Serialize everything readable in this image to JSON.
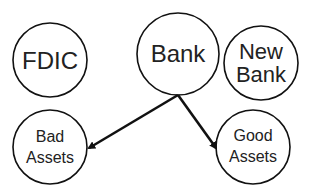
{
  "diagram": {
    "nodes": [
      {
        "id": "fdic",
        "lines": [
          "FDIC"
        ],
        "cx": 50,
        "cy": 60,
        "r": 37,
        "font": 24
      },
      {
        "id": "bank",
        "lines": [
          "Bank"
        ],
        "cx": 178,
        "cy": 54,
        "r": 41,
        "font": 24
      },
      {
        "id": "new-bank",
        "lines": [
          "New",
          "Bank"
        ],
        "cx": 261,
        "cy": 63,
        "r": 37,
        "font": 23
      },
      {
        "id": "bad-assets",
        "lines": [
          "Bad",
          "Assets"
        ],
        "cx": 50,
        "cy": 147,
        "r": 37,
        "font": 17
      },
      {
        "id": "good-assets",
        "lines": [
          "Good",
          "Assets"
        ],
        "cx": 253,
        "cy": 147,
        "r": 37,
        "font": 17
      }
    ],
    "edges": [
      {
        "from": "bank",
        "to": "bad-assets",
        "x1": 178,
        "y1": 95,
        "x2": 88,
        "y2": 149
      },
      {
        "from": "bank",
        "to": "good-assets",
        "x1": 178,
        "y1": 95,
        "x2": 217,
        "y2": 149
      }
    ],
    "stroke_color": "#111111"
  },
  "labels": {
    "fdic": {
      "line1": "FDIC"
    },
    "bank": {
      "line1": "Bank"
    },
    "new_bank": {
      "line1": "New",
      "line2": "Bank"
    },
    "bad_assets": {
      "line1": "Bad",
      "line2": "Assets"
    },
    "good_assets": {
      "line1": "Good",
      "line2": "Assets"
    }
  }
}
